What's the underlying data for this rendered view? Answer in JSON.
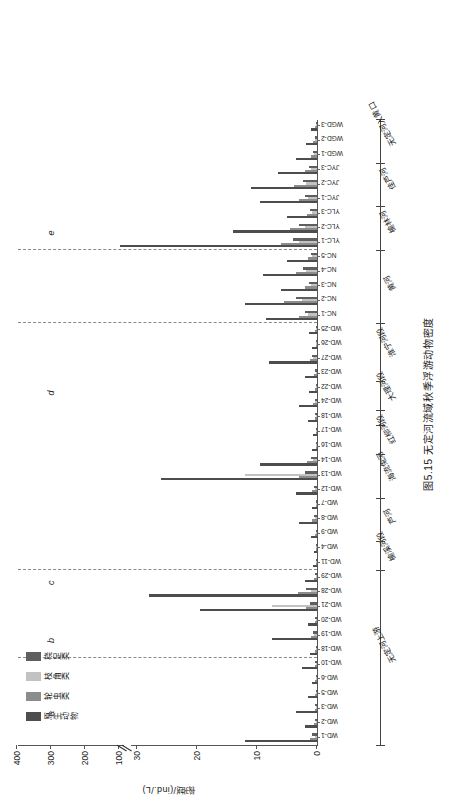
{
  "figure": {
    "caption": "图5.15  无定河流域秋季浮游动物密度",
    "y_axis_label": "密度/(ind./L)",
    "region_letters": [
      "a",
      "b",
      "c",
      "d",
      "e"
    ]
  },
  "legend": {
    "items": [
      {
        "label": "原生动物",
        "color": "#4d4d4d"
      },
      {
        "label": "轮虫类",
        "color": "#8c8c8c"
      },
      {
        "label": "枝角类",
        "color": "#c2c2c2"
      },
      {
        "label": "桡足类",
        "color": "#5f5f5f"
      }
    ]
  },
  "regions": [
    {
      "label": "无定河上游",
      "from": "WD-1",
      "to": "WD-29"
    },
    {
      "label": "榆溪河段",
      "from": "WD-11",
      "to": "WD-4"
    },
    {
      "label": "芦河",
      "from": "WD-9",
      "to": "WD-7"
    },
    {
      "label": "海流兔河",
      "from": "WD-12",
      "to": "WD-14"
    },
    {
      "label": "红柳河段",
      "from": "WD-16",
      "to": "WD-17"
    },
    {
      "label": "大理河段",
      "from": "WD-24",
      "to": "WD-22"
    },
    {
      "label": "淮宁河段",
      "from": "WD-23",
      "to": "WD-25"
    },
    {
      "label": "黄河",
      "from": "NC-1",
      "to": "NC-5"
    },
    {
      "label": "榆林河",
      "from": "YLC-1",
      "to": "YLC-3"
    },
    {
      "label": "佳芦河",
      "from": "JYC-1",
      "to": "JYC-3"
    },
    {
      "label": "无定河入黄口",
      "from": "WGD-1",
      "to": "WGD-3"
    }
  ],
  "chart_data": {
    "type": "bar",
    "title": "图5.15  无定河流域秋季浮游动物密度",
    "xlabel": "",
    "ylabel": "密度/(ind./L)",
    "orientation": "vertical-grouped",
    "ylim": [
      0,
      400
    ],
    "y_ticks": [
      0,
      10,
      20,
      30,
      100,
      200,
      300,
      400
    ],
    "axis_break_between": [
      30,
      100
    ],
    "grid": false,
    "legend_position": "top-left",
    "categories": [
      "WD-1",
      "WD-2",
      "WD-3",
      "WD-5",
      "WD-6",
      "WD-10",
      "WD-18",
      "WD-19",
      "WD-20",
      "WD-21",
      "WD-28",
      "WD-29",
      "WD-11",
      "WD-4",
      "WD-9",
      "WD-8",
      "WD-7",
      "WD-12",
      "WD-13",
      "WD-14",
      "WD-16",
      "WD-17",
      "WD-18B",
      "WD-24",
      "WD-22",
      "WD-23",
      "WD-27",
      "WD-26",
      "WD-25",
      "NC-1",
      "NC-2",
      "NC-3",
      "NC-4",
      "NC-5",
      "YLC-1",
      "YLC-2",
      "YLC-3",
      "JYC-1",
      "JYC-2",
      "JYC-3",
      "WGD-1",
      "WGD-2",
      "WGD-3"
    ],
    "series": [
      {
        "name": "原生动物",
        "color": "#4d4d4d",
        "values": [
          12.0,
          2.0,
          3.5,
          1.5,
          0.8,
          2.5,
          1.2,
          7.5,
          1.5,
          19.5,
          28.0,
          2.0,
          0.6,
          0.5,
          1.0,
          3.0,
          0.9,
          3.5,
          26.0,
          9.5,
          0.8,
          0.6,
          1.5,
          3.0,
          1.4,
          2.0,
          8.0,
          0.8,
          1.4,
          8.5,
          12.0,
          6.0,
          9.0,
          5.0,
          98.0,
          14.0,
          5.0,
          9.5,
          11.0,
          6.5,
          3.5,
          1.8,
          1.0
        ]
      },
      {
        "name": "轮虫类",
        "color": "#8c8c8c",
        "values": [
          1.2,
          0.5,
          0.4,
          0.3,
          0.3,
          0.4,
          0.3,
          1.0,
          0.4,
          1.8,
          3.2,
          0.5,
          0.2,
          0.2,
          0.3,
          0.8,
          0.2,
          0.8,
          3.0,
          1.6,
          0.2,
          0.2,
          0.4,
          0.6,
          0.3,
          0.5,
          1.2,
          0.2,
          0.3,
          3.0,
          5.5,
          2.0,
          3.5,
          1.5,
          6.0,
          4.5,
          1.6,
          3.0,
          3.8,
          2.0,
          1.0,
          0.6,
          0.3
        ]
      },
      {
        "name": "枝角类",
        "color": "#c2c2c2",
        "values": [
          0.4,
          0.2,
          0.2,
          0.1,
          0.1,
          0.2,
          0.1,
          0.5,
          0.2,
          7.5,
          1.0,
          0.2,
          0.1,
          0.1,
          0.2,
          0.3,
          0.1,
          0.3,
          12.0,
          0.7,
          0.1,
          0.1,
          0.2,
          0.3,
          0.1,
          0.2,
          0.6,
          0.1,
          0.2,
          1.5,
          2.5,
          1.0,
          1.8,
          0.8,
          3.0,
          2.0,
          0.8,
          1.5,
          1.8,
          1.0,
          0.5,
          0.3,
          0.2
        ]
      },
      {
        "name": "桡足类",
        "color": "#5f5f5f",
        "values": [
          0.8,
          0.3,
          0.3,
          0.2,
          0.2,
          0.3,
          0.2,
          0.7,
          0.3,
          1.2,
          1.8,
          0.3,
          0.1,
          0.1,
          0.2,
          0.5,
          0.2,
          0.5,
          2.0,
          1.0,
          0.1,
          0.1,
          0.3,
          0.4,
          0.2,
          0.3,
          0.8,
          0.1,
          0.2,
          2.0,
          3.5,
          1.4,
          2.4,
          1.0,
          4.0,
          3.0,
          1.2,
          2.0,
          2.4,
          1.4,
          0.7,
          0.4,
          0.2
        ]
      }
    ],
    "region_separators_after": [
      "WD-29",
      "WD-10",
      "WD-25",
      "NC-5"
    ],
    "region_letters": [
      {
        "letter": "a",
        "near": "WD-3"
      },
      {
        "letter": "b",
        "near": "WD-19"
      },
      {
        "letter": "c",
        "near": "WD-29"
      },
      {
        "letter": "d",
        "near": "WD-22"
      },
      {
        "letter": "e",
        "near": "YLC-2"
      }
    ]
  }
}
